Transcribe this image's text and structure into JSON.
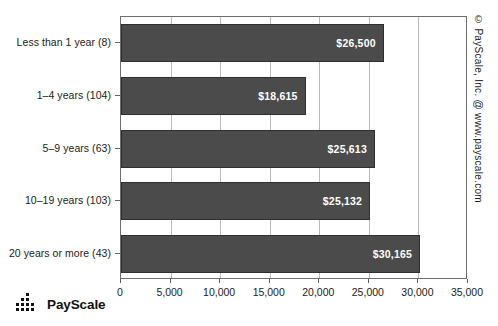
{
  "chart_data": {
    "type": "bar",
    "orientation": "horizontal",
    "title": "",
    "xlabel": "",
    "ylabel": "",
    "xlim": [
      0,
      35000
    ],
    "xticks": [
      0,
      5000,
      10000,
      15000,
      20000,
      25000,
      30000,
      35000
    ],
    "xtick_labels": [
      "0",
      "5,000",
      "10,000",
      "15,000",
      "20,000",
      "25,000",
      "30,000",
      "35,000"
    ],
    "grid": true,
    "grid_axis": "x",
    "legend": "none",
    "categories": [
      "Less than 1 year (8)",
      "1–4 years (104)",
      "5–9 years (63)",
      "10–19 years (103)",
      "20 years or more (43)"
    ],
    "values": [
      26500,
      18615,
      25613,
      25132,
      30165
    ],
    "value_labels": [
      "$26,500",
      "$18,615",
      "$25,613",
      "$25,132",
      "$30,165"
    ],
    "bar_color": "#4b4b4b",
    "bar_border_color": "#2e2e2e",
    "value_label_color": "#ffffff",
    "gridline_color": "#b9b9b9",
    "plot_border_color": "#6e6e6e",
    "background_color": "#ffffff"
  },
  "annotations": {
    "copyright": "© PayScale, Inc. @ www.payscale.com"
  },
  "logo": {
    "text": "PayScale",
    "mark": "dot-matrix-bars-icon"
  }
}
